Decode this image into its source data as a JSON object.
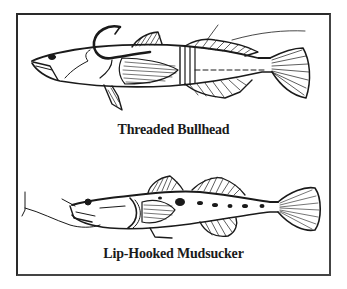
{
  "figure": {
    "panels": [
      {
        "id": "threaded-bullhead",
        "caption": "Threaded Bullhead",
        "subject": "bullhead fish threaded onto hook with line",
        "icon": "fish-hook-icon"
      },
      {
        "id": "lip-hooked-mudsucker",
        "caption": "Lip-Hooked Mudsucker",
        "subject": "mudsucker fish hooked through lip",
        "icon": "fish-hook-icon"
      }
    ],
    "colors": {
      "ink": "#1a1a1a",
      "border": "#2a2a2a",
      "background": "#ffffff"
    }
  }
}
